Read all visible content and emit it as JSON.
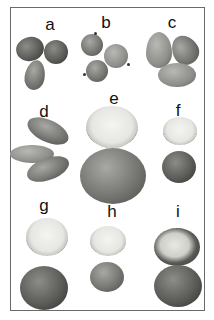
{
  "figure": {
    "panels": [
      {
        "id": "a",
        "label": "a",
        "count": 3,
        "form": "whole nuts, angular/ridged husks"
      },
      {
        "id": "b",
        "label": "b",
        "count": 3,
        "form": "whole nuts, round with small stems"
      },
      {
        "id": "c",
        "label": "c",
        "count": 3,
        "form": "whole nuts, pointed tips"
      },
      {
        "id": "d",
        "label": "d",
        "count": 3,
        "form": "whole nuts, elongated oblong"
      },
      {
        "id": "e",
        "label": "e",
        "count": 2,
        "form": "cracked shell (top) and whole nut (bottom), large"
      },
      {
        "id": "f",
        "label": "f",
        "count": 2,
        "form": "cracked shell (top) and whole nut (bottom), small"
      },
      {
        "id": "g",
        "label": "g",
        "count": 2,
        "form": "cracked shell (top) and whole nut (bottom)"
      },
      {
        "id": "h",
        "label": "h",
        "count": 2,
        "form": "cracked shell (top) and whole nut (bottom), small"
      },
      {
        "id": "i",
        "label": "i",
        "count": 2,
        "form": "cracked shell (top) and whole nut (bottom)"
      }
    ]
  },
  "colors": {
    "background": "#ffffff",
    "frame_border": "#6a6a6a",
    "label_text": "#111111"
  }
}
